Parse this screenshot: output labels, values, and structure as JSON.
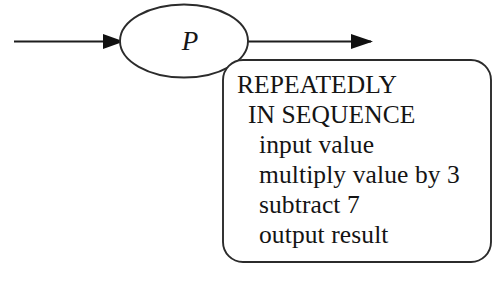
{
  "canvas": {
    "width": 503,
    "height": 283,
    "background": "#ffffff",
    "stroke_color": "#1d1d1d",
    "text_color": "#141414"
  },
  "process_node": {
    "label": "P",
    "shape": "ellipse"
  },
  "arrows": {
    "input": {
      "name": "input-arrow",
      "direction": "right"
    },
    "output": {
      "name": "output-arrow",
      "direction": "right"
    }
  },
  "spec_box": {
    "shape": "rounded-rectangle",
    "lines": [
      {
        "text": "REPEATEDLY",
        "indent": 0
      },
      {
        "text": "IN SEQUENCE",
        "indent": 1
      },
      {
        "text": "input value",
        "indent": 2
      },
      {
        "text": "multiply value by 3",
        "indent": 2
      },
      {
        "text": "subtract 7",
        "indent": 2
      },
      {
        "text": "output result",
        "indent": 2
      }
    ]
  }
}
